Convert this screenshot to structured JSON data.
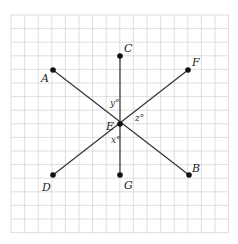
{
  "diagram": {
    "grid": {
      "x0": 11,
      "y0": 15,
      "cols": 16,
      "rows": 16,
      "cell": 13.6,
      "color": "#d6d6d6"
    },
    "points": [
      {
        "name": "A",
        "x": 53,
        "y": 70,
        "lx": 41,
        "ly": 82
      },
      {
        "name": "C",
        "x": 120,
        "y": 56,
        "lx": 124,
        "ly": 52
      },
      {
        "name": "F",
        "x": 188,
        "y": 70,
        "lx": 192,
        "ly": 66
      },
      {
        "name": "E",
        "x": 120,
        "y": 124,
        "lx": 106,
        "ly": 130
      },
      {
        "name": "D",
        "x": 53,
        "y": 175,
        "lx": 42,
        "ly": 191
      },
      {
        "name": "G",
        "x": 120,
        "y": 175,
        "lx": 124,
        "ly": 189
      },
      {
        "name": "B",
        "x": 189,
        "y": 175,
        "lx": 192,
        "ly": 172
      }
    ],
    "angles": [
      {
        "label": "y°",
        "x": 110,
        "y": 106
      },
      {
        "label": "z°",
        "x": 135,
        "y": 121
      },
      {
        "label": "x°",
        "x": 111,
        "y": 143
      }
    ]
  }
}
